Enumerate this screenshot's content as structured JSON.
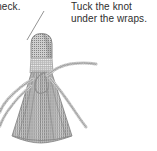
{
  "page": {
    "width": 157,
    "height": 151,
    "background_color": "#ffffff",
    "illustration_type": "line-art craft instruction diagram"
  },
  "captions": {
    "left": {
      "text": "l neck.",
      "note": "text is clipped by the left edge of the image",
      "color": "#2e2e2e"
    },
    "right": {
      "line1": "Tuck the knot",
      "line2": "under the wraps.",
      "color": "#2e2e2e"
    }
  },
  "illustration": {
    "name": "yarn-tassel-doll",
    "leader_line": {
      "name": "neck-leader-line",
      "from_x": 44,
      "from_y": 11,
      "to_x": 26,
      "to_y": 40,
      "color": "#8a8a8a"
    },
    "parts": [
      {
        "name": "head",
        "shape": "dome",
        "fill": "#9a9a9a",
        "texture": "halftone-dots"
      },
      {
        "name": "neck-wrap-band",
        "shape": "band",
        "fill": "#c9c9c9",
        "texture": "grid"
      },
      {
        "name": "tassel-skirt",
        "shape": "flared-bell",
        "fill": "#a2a2a2",
        "texture": "vertical-strands"
      },
      {
        "name": "knot-loop",
        "shape": "loop",
        "stroke": "#8f8f8f"
      },
      {
        "name": "tuck-cord",
        "shape": "curved-cord",
        "stroke": "#9b9b9b"
      },
      {
        "name": "stray-cord-left-upper",
        "shape": "curved-cord",
        "stroke": "#9b9b9b"
      },
      {
        "name": "stray-cord-left-lower",
        "shape": "curved-cord",
        "stroke": "#9b9b9b"
      },
      {
        "name": "stray-cord-right",
        "shape": "curved-cord",
        "stroke": "#9b9b9b"
      }
    ],
    "colors": {
      "ink": "#8a8a8a",
      "head_fill": "#9a9a9a",
      "wrap_fill": "#c9c9c9",
      "skirt_fill": "#a2a2a2",
      "text": "#2e2e2e"
    }
  }
}
